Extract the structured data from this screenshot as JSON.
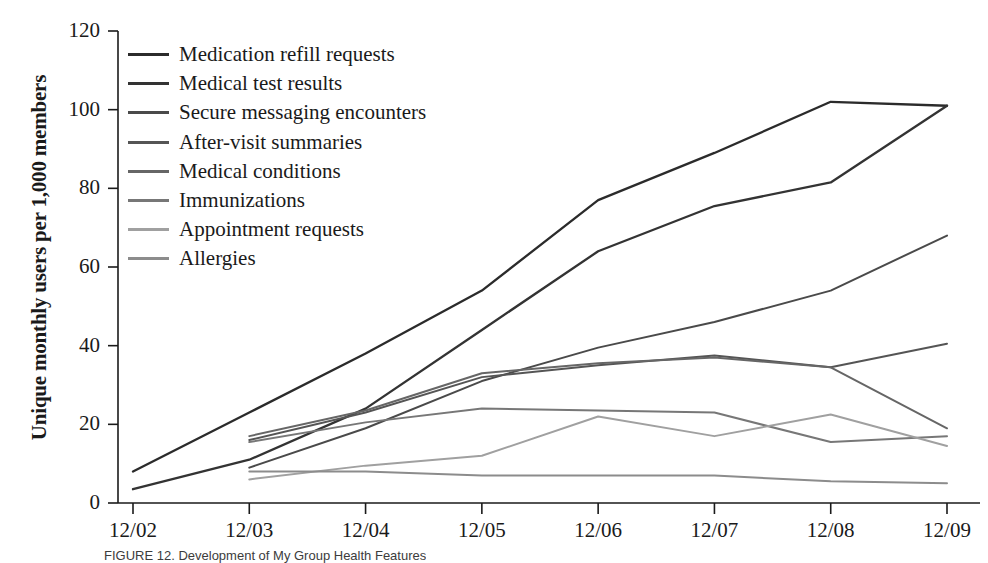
{
  "figure": {
    "caption": "FIGURE 12. Development of My Group Health Features"
  },
  "chart_data": {
    "type": "line",
    "title": "",
    "xlabel": "",
    "ylabel": "Unique monthly users per 1,000 members",
    "categories": [
      "12/02",
      "12/03",
      "12/04",
      "12/05",
      "12/06",
      "12/07",
      "12/08",
      "12/09"
    ],
    "x_tick_labels": [
      "12/02",
      "12/03",
      "12/04",
      "12/05",
      "12/06",
      "12/07",
      "12/08",
      "12/09"
    ],
    "y_tick_labels": [
      "0",
      "20",
      "40",
      "60",
      "80",
      "100",
      "120"
    ],
    "ylim": [
      0,
      120
    ],
    "y_ticks": [
      0,
      20,
      40,
      60,
      80,
      100,
      120
    ],
    "grid": false,
    "legend_position": "upper-left",
    "series": [
      {
        "name": "Medication refill requests",
        "color": "#2b2b2b",
        "values": [
          8,
          23,
          38,
          54,
          77,
          89,
          102,
          101
        ]
      },
      {
        "name": "Medical test results",
        "color": "#333333",
        "values": [
          3.5,
          11,
          24,
          44,
          64,
          75.5,
          81.5,
          101
        ]
      },
      {
        "name": "Secure messaging encounters",
        "color": "#4a4a4a",
        "values": [
          null,
          9,
          19,
          31,
          39.5,
          46,
          54,
          68
        ]
      },
      {
        "name": "After-visit summaries",
        "color": "#555555",
        "values": [
          null,
          16,
          23,
          32,
          35,
          37.5,
          34.5,
          40.5
        ]
      },
      {
        "name": "Medical conditions",
        "color": "#666666",
        "values": [
          null,
          17,
          23.5,
          33,
          35.5,
          37,
          34.5,
          19
        ]
      },
      {
        "name": "Immunizations",
        "color": "#777777",
        "values": [
          null,
          15.5,
          20.5,
          24,
          23.5,
          23,
          15.5,
          17
        ]
      },
      {
        "name": "Appointment requests",
        "color": "#a0a0a0",
        "values": [
          null,
          6,
          9.5,
          12,
          22,
          17,
          22.5,
          14.5
        ]
      },
      {
        "name": "Allergies",
        "color": "#8c8c8c",
        "values": [
          null,
          8,
          8,
          7,
          7,
          7,
          5.5,
          5
        ]
      }
    ]
  },
  "legend": {
    "items": [
      {
        "label": "Medication refill requests"
      },
      {
        "label": "Medical test results"
      },
      {
        "label": "Secure messaging encounters"
      },
      {
        "label": "After-visit summaries"
      },
      {
        "label": "Medical conditions"
      },
      {
        "label": "Immunizations"
      },
      {
        "label": "Appointment requests"
      },
      {
        "label": "Allergies"
      }
    ]
  }
}
